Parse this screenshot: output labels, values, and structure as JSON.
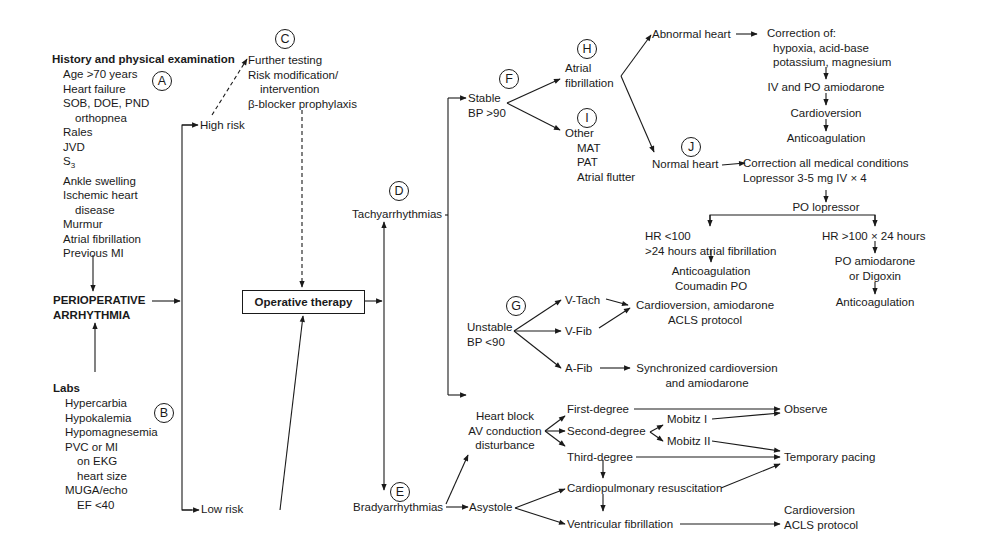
{
  "history": {
    "title": "History and physical examination",
    "items": [
      "Age >70 years",
      "Heart failure",
      "SOB, DOE, PND",
      "orthopnea",
      "Rales",
      "JVD",
      "S",
      "Ankle swelling",
      "Ischemic heart",
      "disease",
      "Murmur",
      "Atrial fibrillation",
      "Previous MI"
    ],
    "s3_sub": "3",
    "label": "A"
  },
  "main": {
    "line1": "PERIOPERATIVE",
    "line2": "ARRHYTHMIA"
  },
  "labs": {
    "title": "Labs",
    "items": [
      "Hypercarbia",
      "Hypokalemia",
      "Hypomagnesemia",
      "PVC or MI",
      "on EKG",
      "heart size",
      "MUGA/echo",
      "EF <40"
    ],
    "label": "B"
  },
  "risk": {
    "high": "High risk",
    "low": "Low risk"
  },
  "high_risk_actions": {
    "label": "C",
    "items": [
      "Further testing",
      "Risk modification/",
      "intervention",
      "β-blocker prophylaxis"
    ]
  },
  "operative": {
    "label": "Operative therapy"
  },
  "tachy": {
    "label": "D",
    "text": "Tachyarrhythmias"
  },
  "brady": {
    "label": "E",
    "text": "Bradyarrhythmias"
  },
  "stable": {
    "label": "F",
    "line1": "Stable",
    "line2": "BP >90"
  },
  "unstable": {
    "label": "G",
    "line1": "Unstable",
    "line2": "BP <90"
  },
  "afib": {
    "label": "H",
    "line1": "Atrial",
    "line2": "fibrillation"
  },
  "other": {
    "label": "I",
    "title": "Other",
    "items": [
      "MAT",
      "PAT",
      "Atrial flutter"
    ]
  },
  "abnormal_heart": {
    "text": "Abnormal heart",
    "correction": [
      "Correction of:",
      "hypoxia, acid-base",
      "potassium, magnesium"
    ],
    "steps": [
      "IV and PO amiodarone",
      "Cardioversion",
      "Anticoagulation"
    ]
  },
  "normal_heart": {
    "label": "J",
    "text": "Normal heart",
    "correction": [
      "Correction all medical conditions",
      "Lopressor 3-5 mg IV × 4"
    ],
    "po": "PO lopressor",
    "left_branch": {
      "cond": [
        "HR <100",
        ">24 hours atrial fibrillation"
      ],
      "result": [
        "Anticoagulation",
        "Coumadin PO"
      ]
    },
    "right_branch": {
      "cond": "HR >100 × 24 hours",
      "drug": [
        "PO amiodarone",
        "or Digoxin"
      ],
      "result": "Anticoagulation"
    }
  },
  "unstable_branches": {
    "vtach": "V-Tach",
    "vfib": "V-Fib",
    "afib": "A-Fib",
    "vt_vf_result": [
      "Cardioversion, amiodarone",
      "ACLS protocol"
    ],
    "afib_result": [
      "Synchronized cardioversion",
      "and amiodarone"
    ]
  },
  "brady_branches": {
    "heart_block": [
      "Heart block",
      "AV conduction",
      "disturbance"
    ],
    "first": "First-degree",
    "second": "Second-degree",
    "third": "Third-degree",
    "mobitz1": "Mobitz I",
    "mobitz2": "Mobitz II",
    "asystole": "Asystole",
    "cpr": "Cardiopulmonary resuscitation",
    "vfib": "Ventricular fibrillation",
    "observe": "Observe",
    "pacing": "Temporary pacing",
    "vf_result": [
      "Cardioversion",
      "ACLS protocol"
    ]
  }
}
